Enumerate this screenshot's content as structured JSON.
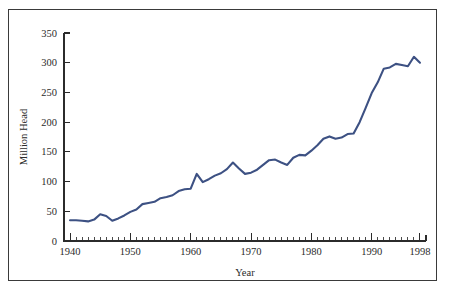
{
  "figure": {
    "background_color": "#ffffff",
    "border_color": "#3a3a3a"
  },
  "chart_data": {
    "type": "line",
    "title": "",
    "subtitle": "",
    "xlabel": "Year",
    "ylabel": "Million Head",
    "xlim": [
      1939,
      1999
    ],
    "ylim": [
      0,
      350
    ],
    "grid": false,
    "legend": null,
    "legend_position": "none",
    "line_color": "#3d5183",
    "x_major_ticks": [
      1940,
      1950,
      1960,
      1970,
      1980,
      1990,
      1998
    ],
    "x_major_tick_labels": [
      "1940",
      "1950",
      "1960",
      "1970",
      "1980",
      "1990",
      "1998"
    ],
    "x_minor_tick_interval": 1,
    "y_ticks": [
      0,
      50,
      100,
      150,
      200,
      250,
      300,
      350
    ],
    "y_tick_labels": [
      "0",
      "50",
      "100",
      "150",
      "200",
      "250",
      "300",
      "350"
    ],
    "series": [
      {
        "name": "Million Head",
        "x": [
          1940,
          1941,
          1942,
          1943,
          1944,
          1945,
          1946,
          1947,
          1948,
          1949,
          1950,
          1951,
          1952,
          1953,
          1954,
          1955,
          1956,
          1957,
          1958,
          1959,
          1960,
          1961,
          1962,
          1963,
          1964,
          1965,
          1966,
          1967,
          1968,
          1969,
          1970,
          1971,
          1972,
          1973,
          1974,
          1975,
          1976,
          1977,
          1978,
          1979,
          1980,
          1981,
          1982,
          1983,
          1984,
          1985,
          1986,
          1987,
          1988,
          1989,
          1990,
          1991,
          1992,
          1993,
          1994,
          1995,
          1996,
          1997,
          1998
        ],
        "values": [
          35,
          35,
          34,
          33,
          36,
          45,
          42,
          34,
          38,
          43,
          49,
          53,
          62,
          64,
          66,
          72,
          74,
          77,
          84,
          87,
          88,
          113,
          99,
          104,
          110,
          114,
          121,
          132,
          122,
          113,
          115,
          120,
          128,
          136,
          137,
          132,
          128,
          140,
          145,
          144,
          152,
          161,
          172,
          176,
          172,
          174,
          180,
          181,
          200,
          224,
          249,
          267,
          290,
          292,
          298,
          296,
          294,
          310,
          300
        ]
      }
    ],
    "annotations": []
  }
}
